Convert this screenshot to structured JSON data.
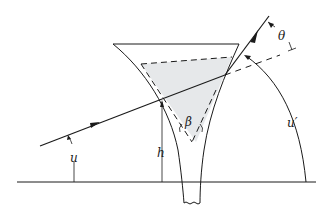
{
  "diagram": {
    "colors": {
      "stroke": "#1a1a1a",
      "fill_shaded": "#e6e8ea",
      "background": "#ffffff"
    },
    "labels": {
      "u": "u",
      "h": "h",
      "beta": "β",
      "u_prime": "u′",
      "theta": "θ"
    }
  }
}
